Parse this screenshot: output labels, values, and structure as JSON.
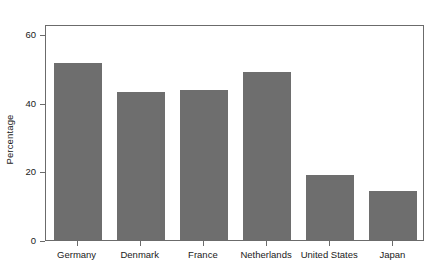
{
  "chart_data": {
    "type": "bar",
    "title": "",
    "subtitle": "",
    "xlabel": "",
    "ylabel": "Percentage",
    "categories": [
      "Germany",
      "Denmark",
      "France",
      "Netherlands",
      "United States",
      "Japan"
    ],
    "values": [
      51.7,
      43.3,
      43.7,
      48.9,
      19.0,
      14.2
    ],
    "ylim": [
      0,
      63
    ],
    "yticks": [
      0,
      20,
      40,
      60
    ],
    "ytick_labels": [
      "0",
      "20",
      "40",
      "60"
    ],
    "grid": false,
    "legend": null,
    "legend_position": "none",
    "bar_color": "#6e6e6e",
    "frame_color": "#6b6b6b",
    "background": "#ffffff",
    "annotations": []
  }
}
